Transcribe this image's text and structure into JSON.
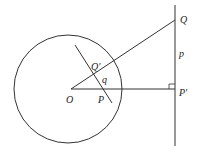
{
  "diagram": {
    "type": "geometry",
    "labels": {
      "O": "O",
      "P": "P",
      "Q_prime": "Q′",
      "q": "q",
      "Q": "Q",
      "p": "p",
      "P_prime": "P′"
    },
    "colors": {
      "stroke": "#333333",
      "background": "#ffffff"
    }
  }
}
